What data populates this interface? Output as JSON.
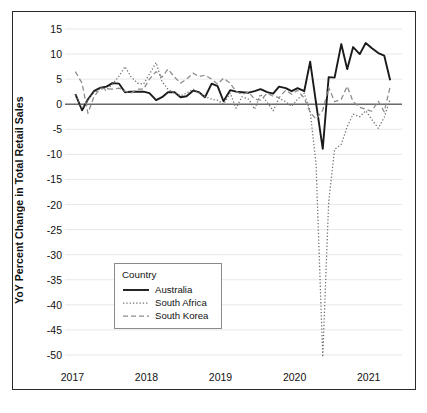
{
  "chart_data": {
    "type": "line",
    "title": "",
    "xlabel": "",
    "ylabel": "YoY Percent Change in Total Retail Sales",
    "ylim": [
      -52,
      16
    ],
    "xlim": [
      2016.9,
      2021.45
    ],
    "yticks": [
      15,
      10,
      5,
      0,
      -5,
      -10,
      -15,
      -20,
      -25,
      -30,
      -35,
      -40,
      -45,
      -50
    ],
    "ytick_labels": [
      "15",
      "10",
      "5",
      "0",
      "-5",
      "-10",
      "-15",
      "-20",
      "-25",
      "-30",
      "-35",
      "-40",
      "-45",
      "-50"
    ],
    "xticks": [
      2017,
      2018,
      2019,
      2020,
      2021
    ],
    "xtick_labels": [
      "2017",
      "2018",
      "2019",
      "2020",
      "2021"
    ],
    "grid": true,
    "zero_line": true,
    "legend": {
      "title": "Country",
      "position": "lower-left-inside",
      "entries": [
        {
          "name": "Australia",
          "style": "solid",
          "color": "#1a1a1a"
        },
        {
          "name": "South Africa",
          "style": "dotted",
          "color": "#6f6f6f"
        },
        {
          "name": "South Korea",
          "style": "dashed",
          "color": "#8a8a8a"
        }
      ]
    },
    "x": [
      2017.04,
      2017.13,
      2017.21,
      2017.29,
      2017.38,
      2017.46,
      2017.54,
      2017.63,
      2017.71,
      2017.79,
      2017.88,
      2017.96,
      2018.04,
      2018.13,
      2018.21,
      2018.29,
      2018.38,
      2018.46,
      2018.54,
      2018.63,
      2018.71,
      2018.79,
      2018.88,
      2018.96,
      2019.04,
      2019.13,
      2019.21,
      2019.29,
      2019.38,
      2019.46,
      2019.54,
      2019.63,
      2019.71,
      2019.79,
      2019.88,
      2019.96,
      2020.04,
      2020.13,
      2020.21,
      2020.29,
      2020.38,
      2020.46,
      2020.54,
      2020.63,
      2020.71,
      2020.79,
      2020.88,
      2020.96,
      2021.04,
      2021.13,
      2021.21,
      2021.29
    ],
    "series": [
      {
        "name": "Australia",
        "style": "solid",
        "color": "#1a1a1a",
        "values": [
          2.0,
          -1.2,
          1.0,
          2.6,
          3.3,
          3.5,
          4.2,
          4.1,
          2.4,
          2.5,
          2.5,
          2.5,
          2.2,
          0.8,
          1.4,
          2.4,
          2.4,
          1.4,
          1.6,
          2.7,
          2.4,
          1.4,
          4.1,
          3.6,
          0.6,
          2.8,
          2.5,
          2.4,
          2.3,
          2.6,
          3.0,
          2.4,
          2.1,
          3.5,
          3.2,
          2.6,
          3.2,
          2.6,
          8.5,
          0.2,
          -8.9,
          5.4,
          5.3,
          12.0,
          7.0,
          11.4,
          10.0,
          12.2,
          11.2,
          10.2,
          9.7,
          4.8
        ]
      },
      {
        "name": "South Africa",
        "style": "dotted",
        "color": "#6f6f6f",
        "values": [
          1.8,
          -0.8,
          0.9,
          2.3,
          3.1,
          2.8,
          4.0,
          5.6,
          7.5,
          5.5,
          4.2,
          4.0,
          6.0,
          8.3,
          4.5,
          3.0,
          2.2,
          1.7,
          2.2,
          3.0,
          2.3,
          1.5,
          1.0,
          0.8,
          0.0,
          2.2,
          -0.8,
          1.5,
          1.0,
          -1.0,
          2.0,
          0.4,
          -1.3,
          1.2,
          0.5,
          -0.4,
          1.0,
          2.2,
          -1.4,
          -12.0,
          -50.4,
          -19.5,
          -9.0,
          -8.0,
          -4.5,
          -2.0,
          -2.5,
          -1.3,
          -3.0,
          -4.8,
          -2.6,
          1.0
        ]
      },
      {
        "name": "South Korea",
        "style": "dashed",
        "color": "#8a8a8a",
        "values": [
          6.5,
          4.2,
          -1.8,
          1.5,
          3.2,
          3.1,
          3.0,
          3.2,
          2.6,
          2.2,
          3.0,
          3.0,
          5.0,
          6.5,
          5.4,
          7.0,
          5.4,
          4.2,
          5.0,
          6.2,
          5.5,
          5.8,
          5.0,
          4.0,
          5.2,
          4.2,
          2.5,
          2.0,
          2.4,
          1.0,
          0.8,
          2.2,
          1.6,
          1.3,
          2.8,
          2.0,
          2.8,
          1.2,
          -1.6,
          -3.0,
          -1.2,
          3.4,
          0.5,
          1.0,
          3.6,
          0.5,
          -0.6,
          -1.0,
          -1.4,
          0.6,
          -1.5,
          3.5
        ]
      }
    ]
  }
}
